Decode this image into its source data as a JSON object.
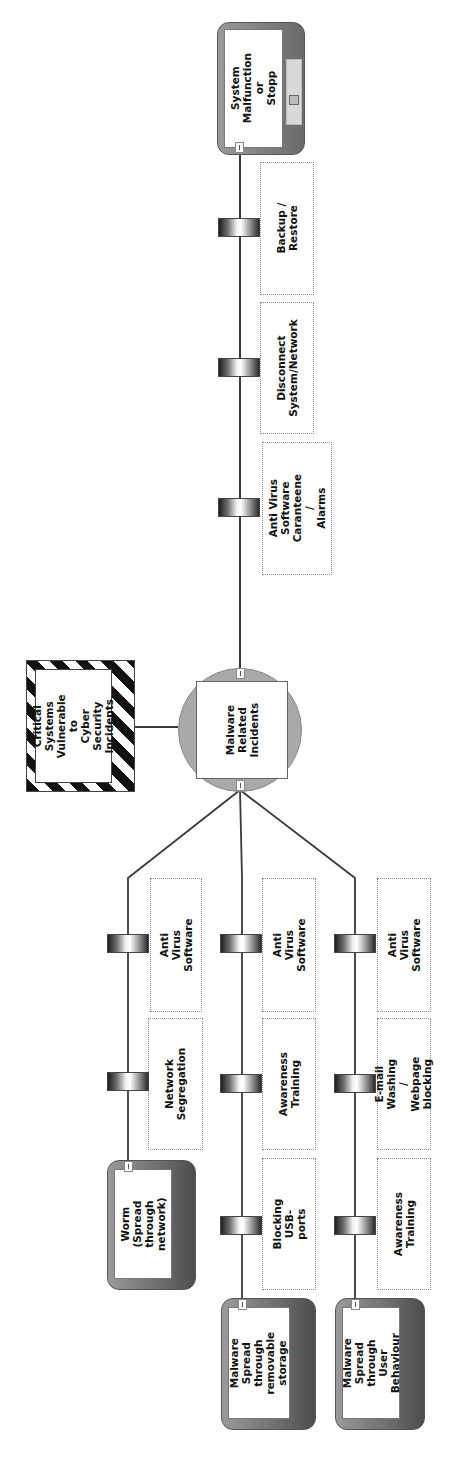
{
  "diagram": {
    "type": "bowtie",
    "orientation": "rotated-90-ccw",
    "hazard": {
      "label": "Critical\nSystems\nVulnerable to\nCyber Security\nIncidents"
    },
    "top_event": {
      "label": "Malware\nRelated\nIncidents"
    },
    "threats": [
      {
        "label": "Worm (Spread\nthrough\nnetwork)",
        "barriers": [
          "Network\nSegregation",
          "Anti Virus\nSoftware"
        ]
      },
      {
        "label": "Malware\nSpread through\nremovable\nstorage",
        "barriers": [
          "Blocking USB-\nports",
          "Awareness\nTraining",
          "Anti Virus\nSoftware"
        ]
      },
      {
        "label": "Malware\nSpread through\nUser Behaviour",
        "barriers": [
          "Awareness\nTraining",
          "E-mail Washing /\nWebpage blocking",
          "Anti Virus\nSoftware"
        ]
      }
    ],
    "consequences": [
      {
        "label": "System\nMalfunction or\nStopp",
        "barriers": [
          "Anti Virus\nSoftware\nCaranteene /\nAlarms",
          "Disconnect\nSystem/Network",
          "Backup / Restore"
        ]
      }
    ]
  }
}
